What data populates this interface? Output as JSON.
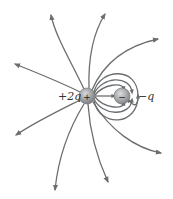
{
  "diagram": {
    "line_color": "#6b6e70",
    "charges": [
      {
        "id": "positive",
        "sign": "+",
        "label": "+2q",
        "cx": 87,
        "cy": 96,
        "r": 8,
        "color": "#9a9c9e"
      },
      {
        "id": "negative",
        "sign": "−",
        "label": "−q",
        "cx": 122,
        "cy": 96,
        "r": 8,
        "color": "#a3a5a7"
      }
    ],
    "outer_lines": [
      {
        "d": "M84,89 C70,60 55,35 51,15",
        "arrow": [
          51,
          14,
          -95
        ]
      },
      {
        "d": "M89,88 C88,55 95,30 105,14",
        "arrow": [
          105,
          14,
          -60
        ]
      },
      {
        "d": "M92,90 C105,60 130,45 158,39",
        "arrow": [
          158,
          39,
          -12
        ]
      },
      {
        "d": "M80,92 C60,82 35,72 15,64",
        "arrow": [
          15,
          64,
          -158
        ]
      },
      {
        "d": "M80,100 C60,110 35,122 16,135",
        "arrow": [
          16,
          135,
          150
        ]
      },
      {
        "d": "M84,104 C68,130 58,160 55,190",
        "arrow": [
          55,
          190,
          95
        ]
      },
      {
        "d": "M88,104 C90,135 98,160 108,182",
        "arrow": [
          108,
          182,
          65
        ]
      },
      {
        "d": "M93,102 C110,130 135,148 161,153",
        "arrow": [
          161,
          153,
          10
        ]
      }
    ],
    "inner_lines": [
      {
        "d": "M94,92 C100,68 138,66 138,96 C138,110 132,104 128,100"
      },
      {
        "d": "M94,94 C102,76 130,75 132,92"
      },
      {
        "d": "M95,95 C104,84 122,82 124,89"
      },
      {
        "d": "M95,96 L114,96"
      },
      {
        "d": "M95,97 C104,108 122,110 124,103"
      },
      {
        "d": "M94,99 C102,116 130,117 132,100"
      },
      {
        "d": "M94,101 C100,128 138,126 138,96"
      }
    ]
  }
}
